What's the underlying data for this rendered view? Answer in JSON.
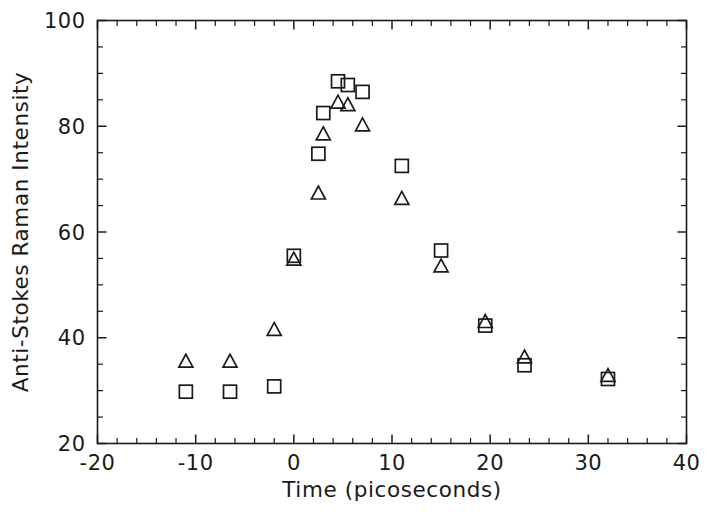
{
  "chart_data": {
    "type": "scatter",
    "title": "",
    "xlabel": "Time  (picoseconds)",
    "ylabel": "Anti-Stokes Raman Intensity",
    "xlim": [
      -20,
      40
    ],
    "ylim": [
      20,
      100
    ],
    "xticks": [
      -20,
      -10,
      0,
      10,
      20,
      30,
      40
    ],
    "xticklabels": [
      "-20",
      "-10",
      "0",
      "10",
      "20",
      "30",
      "40"
    ],
    "yticks": [
      20,
      40,
      60,
      80,
      100
    ],
    "yticklabels": [
      "20",
      "40",
      "60",
      "80",
      "100"
    ],
    "x_minor_tick_interval": 2,
    "y_minor_tick_interval": 5,
    "grid": false,
    "legend": null,
    "legend_position": "none",
    "frame": "box",
    "tick_direction": "in",
    "series": [
      {
        "name": "squares",
        "marker": "square",
        "marker_size": 13,
        "fill": "none",
        "color": "#1a1a1a",
        "x": [
          -11.0,
          -6.5,
          -2.0,
          0.0,
          2.5,
          3.0,
          4.5,
          5.5,
          7.0,
          11.0,
          15.0,
          19.5,
          23.5,
          32.0
        ],
        "y": [
          29.8,
          29.8,
          30.8,
          55.5,
          74.8,
          82.5,
          88.5,
          87.8,
          86.5,
          72.5,
          56.5,
          42.3,
          34.8,
          32.2
        ]
      },
      {
        "name": "triangles",
        "marker": "triangle",
        "marker_size": 14,
        "fill": "none",
        "color": "#1a1a1a",
        "x": [
          -11.0,
          -6.5,
          -2.0,
          0.0,
          2.5,
          3.0,
          4.5,
          5.5,
          7.0,
          11.0,
          15.0,
          19.5,
          23.5,
          32.0
        ],
        "y": [
          35.5,
          35.5,
          41.5,
          54.8,
          67.3,
          78.5,
          84.5,
          84.0,
          80.2,
          66.3,
          53.5,
          43.0,
          36.3,
          32.8
        ]
      }
    ]
  },
  "axis_labels": {
    "x_title": "Time  (picoseconds)",
    "y_title": "Anti-Stokes Raman Intensity"
  },
  "colors": {
    "ink": "#1a1a1a",
    "background": "#ffffff"
  }
}
